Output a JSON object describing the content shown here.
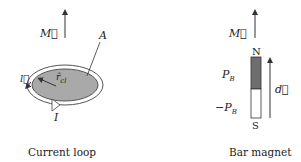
{
  "current_loop": {
    "caption": "Current loop",
    "moment_label": "M⃗",
    "area_label": "A",
    "current_label": "I",
    "unit_vector_label": "r̂",
    "unit_vector_sub": "cl",
    "element_label": "l⃗",
    "fill_color": "#a9a9a9"
  },
  "bar_magnet": {
    "caption": "Bar magnet",
    "moment_label": "M⃗",
    "north_label": "N",
    "south_label": "S",
    "pole_plus_label": "P",
    "pole_plus_sub": "B",
    "pole_minus_label": "−P",
    "pole_minus_sub": "B",
    "dipole_label": "d⃗",
    "north_color": "#6e6e6e",
    "south_color": "#ffffff"
  }
}
